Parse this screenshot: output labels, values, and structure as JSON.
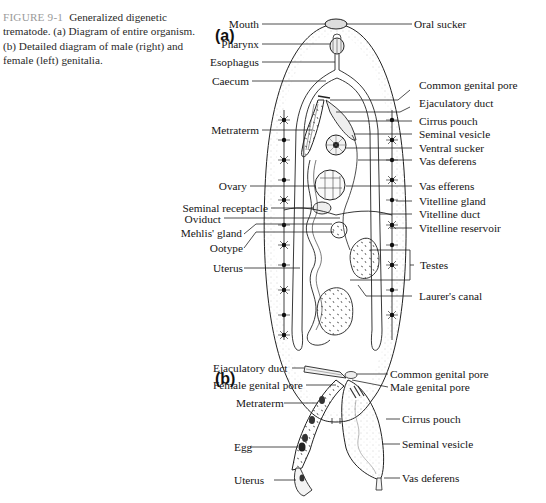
{
  "caption": {
    "figure_number": "FIGURE 9-1",
    "text": "Generalized digenetic trematode. (a) Diagram of entire organism. (b) Detailed diagram of male (right) and female (left) genitalia."
  },
  "panel_a": {
    "label": "(a)",
    "left_labels": [
      {
        "id": "mouth",
        "text": "Mouth"
      },
      {
        "id": "pharynx",
        "text": "Pharynx"
      },
      {
        "id": "esophagus",
        "text": "Esophagus"
      },
      {
        "id": "caecum",
        "text": "Caecum"
      },
      {
        "id": "metraterm",
        "text": "Metraterm"
      },
      {
        "id": "ovary",
        "text": "Ovary"
      },
      {
        "id": "seminal_receptacle",
        "text": "Seminal receptacle"
      },
      {
        "id": "oviduct",
        "text": "Oviduct"
      },
      {
        "id": "mehlis_gland",
        "text": "Mehlis' gland"
      },
      {
        "id": "ootype",
        "text": "Ootype"
      },
      {
        "id": "uterus",
        "text": "Uterus"
      }
    ],
    "right_labels": [
      {
        "id": "oral_sucker",
        "text": "Oral sucker"
      },
      {
        "id": "common_genital_pore",
        "text": "Common genital pore"
      },
      {
        "id": "ejaculatory_duct",
        "text": "Ejaculatory duct"
      },
      {
        "id": "cirrus_pouch",
        "text": "Cirrus pouch"
      },
      {
        "id": "seminal_vesicle",
        "text": "Seminal vesicle"
      },
      {
        "id": "ventral_sucker",
        "text": "Ventral sucker"
      },
      {
        "id": "vas_deferens",
        "text": "Vas deferens"
      },
      {
        "id": "vas_efferens",
        "text": "Vas efferens"
      },
      {
        "id": "vitelline_gland",
        "text": "Vitelline gland"
      },
      {
        "id": "vitelline_duct",
        "text": "Vitelline duct"
      },
      {
        "id": "vitelline_reservoir",
        "text": "Vitelline reservoir"
      },
      {
        "id": "testes",
        "text": "Testes"
      },
      {
        "id": "laurers_canal",
        "text": "Laurer's canal"
      }
    ]
  },
  "panel_b": {
    "label": "(b)",
    "left_labels": [
      {
        "id": "ejaculatory_duct",
        "text": "Ejaculatory duct"
      },
      {
        "id": "female_genital_pore",
        "text": "Female genital pore"
      },
      {
        "id": "metraterm",
        "text": "Metraterm"
      },
      {
        "id": "egg",
        "text": "Egg"
      },
      {
        "id": "uterus",
        "text": "Uterus"
      }
    ],
    "right_labels": [
      {
        "id": "common_genital_pore",
        "text": "Common genital pore"
      },
      {
        "id": "male_genital_pore",
        "text": "Male genital pore"
      },
      {
        "id": "cirrus_pouch",
        "text": "Cirrus pouch"
      },
      {
        "id": "seminal_vesicle",
        "text": "Seminal vesicle"
      },
      {
        "id": "vas_deferens",
        "text": "Vas deferens"
      }
    ]
  }
}
